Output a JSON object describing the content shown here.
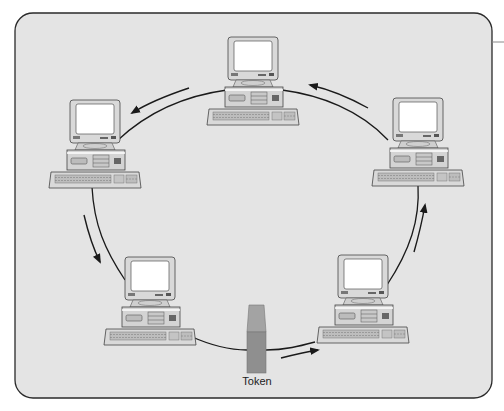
{
  "diagram": {
    "type": "token-ring-network",
    "token_label": "Token",
    "node_count": 5,
    "nodes": [
      {
        "id": "top",
        "x": 203,
        "y": 37
      },
      {
        "id": "top-left",
        "x": 45,
        "y": 100
      },
      {
        "id": "top-right",
        "x": 368,
        "y": 98
      },
      {
        "id": "bottom-left",
        "x": 100,
        "y": 257
      },
      {
        "id": "bottom-right",
        "x": 313,
        "y": 255
      }
    ],
    "flow_direction": "counter-clockwise",
    "colors": {
      "panel_background": "#e4e4e4",
      "panel_border": "#2a2a2a",
      "ring_line": "#1a1a1a",
      "token_fill": "#8f8f8f",
      "token_top": "#a3a3a3",
      "screen": "#ffffff",
      "computer_body": "#d6d6d6"
    }
  }
}
